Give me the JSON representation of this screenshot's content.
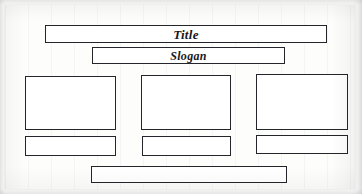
{
  "document": {
    "kind": "paper-wireframe-sketch",
    "medium": "lined paper scan",
    "paper_color": "#fdfdfc",
    "ink_color": "#23252a",
    "backdrop_color": "#f7f7f6"
  },
  "blocks": {
    "title": {
      "name": "title-bar",
      "label": "Title",
      "has_text": true
    },
    "slogan": {
      "name": "slogan-bar",
      "label": "Slogan",
      "has_text": true
    },
    "content_left": {
      "name": "content-box-left",
      "label": "",
      "has_text": false
    },
    "content_middle": {
      "name": "content-box-middle",
      "label": "",
      "has_text": false
    },
    "content_right": {
      "name": "content-box-right",
      "label": "",
      "has_text": false
    },
    "caption_left": {
      "name": "caption-box-left",
      "label": "",
      "has_text": false
    },
    "caption_middle": {
      "name": "caption-box-middle",
      "label": "",
      "has_text": false
    },
    "caption_right": {
      "name": "caption-box-right",
      "label": "",
      "has_text": false
    },
    "footer": {
      "name": "footer-bar",
      "label": "",
      "has_text": false
    }
  }
}
